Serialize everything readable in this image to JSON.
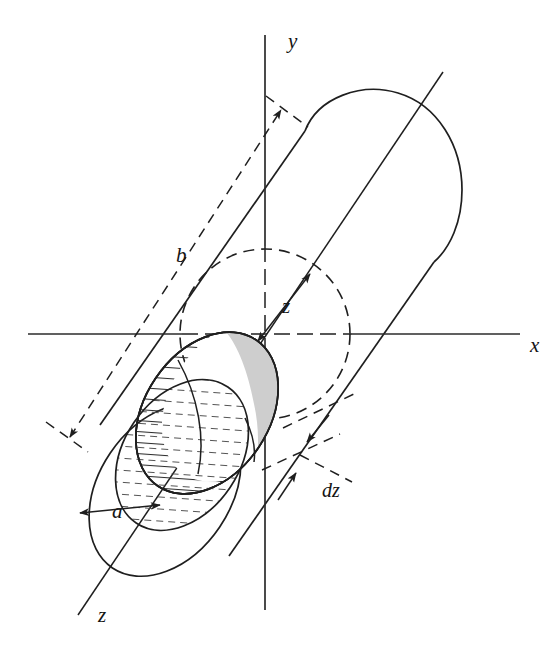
{
  "figure": {
    "background_color": "#ffffff",
    "line_color": "#1f1f1f",
    "shade_color": "#cccccc",
    "hatch_color": "#3a3a3a"
  },
  "axes": [
    {
      "name": "y-axis",
      "label": "y",
      "label_x": 288,
      "label_y": 48
    },
    {
      "name": "x-axis",
      "label": "x",
      "label_x": 530,
      "label_y": 352
    },
    {
      "name": "z-axis",
      "label": "z",
      "label_x": 98,
      "label_y": 622
    }
  ],
  "labels": {
    "y": "y",
    "x": "x",
    "z_axis": "z",
    "z_distance": "z",
    "radius": "a",
    "half_length": "b",
    "thickness": "dz"
  },
  "annotations": [
    {
      "name": "half-length-dimension",
      "label": "b",
      "label_x": 176,
      "label_y": 262,
      "style": "dashed double arrow"
    },
    {
      "name": "z-distance-dimension",
      "label": "z",
      "label_x": 282,
      "label_y": 313,
      "style": "double arrow from origin"
    },
    {
      "name": "radius-dimension",
      "label": "a",
      "label_x": 112,
      "label_y": 518,
      "style": "double arrow"
    },
    {
      "name": "thickness-dimension",
      "label": "dz",
      "label_x": 322,
      "label_y": 497,
      "style": "opposing arrows"
    }
  ],
  "geometry": {
    "origin": {
      "x": 265,
      "y": 334
    },
    "cylinder_axis_angle_deg": 56,
    "dashed_circle_radius": 85,
    "x_axis_extent": {
      "x1": 28,
      "x2": 520,
      "y": 334
    },
    "y_axis_extent": {
      "x": 265,
      "y1": 35,
      "y2": 610
    }
  }
}
